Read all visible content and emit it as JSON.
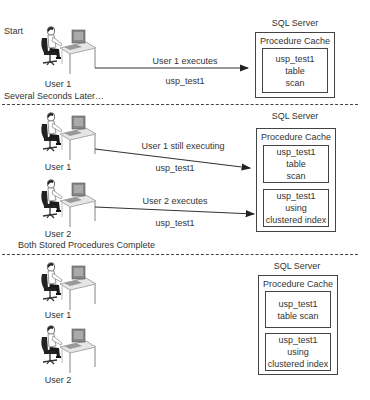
{
  "diagram": {
    "panels": [
      {
        "heading": "Start",
        "users": [
          {
            "label": "User 1"
          }
        ],
        "arrows": [
          {
            "above": "User 1 executes",
            "below": "usp_test1"
          }
        ],
        "server": {
          "title": "SQL Server",
          "cache_title": "Procedure Cache",
          "plans": [
            {
              "lines": [
                "usp_test1",
                "table",
                "scan"
              ]
            }
          ]
        }
      },
      {
        "heading": "Several Seconds Later…",
        "users": [
          {
            "label": "User 1"
          },
          {
            "label": "User 2"
          }
        ],
        "arrows": [
          {
            "above": "User 1 still executing",
            "below": "usp_test1"
          },
          {
            "above": "User 2 executes",
            "below": "usp_test1"
          }
        ],
        "server": {
          "title": "SQL Server",
          "cache_title": "Procedure Cache",
          "plans": [
            {
              "lines": [
                "usp_test1",
                "table",
                "scan"
              ]
            },
            {
              "lines": [
                "usp_test1",
                "using",
                "clustered index"
              ]
            }
          ]
        }
      },
      {
        "heading": "Both Stored Procedures Complete",
        "users": [
          {
            "label": "User 1"
          },
          {
            "label": "User 2"
          }
        ],
        "arrows": [],
        "server": {
          "title": "SQL Server",
          "cache_title": "Procedure Cache",
          "plans": [
            {
              "lines": [
                "usp_test1",
                "table scan"
              ]
            },
            {
              "lines": [
                "usp_test1",
                "using",
                "clustered index"
              ]
            }
          ]
        }
      }
    ],
    "icons": {
      "user": "user-at-computer-icon",
      "arrow": "arrow-right-icon"
    }
  }
}
